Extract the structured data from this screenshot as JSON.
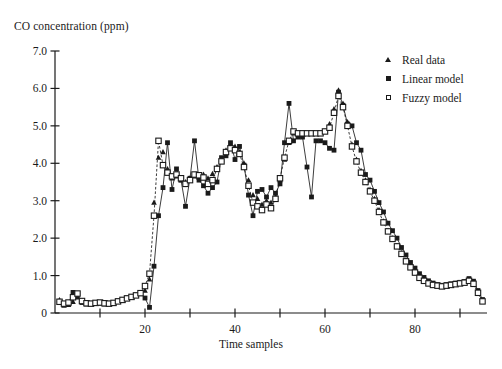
{
  "chart_data": {
    "type": "line",
    "title": "",
    "ylabel": "CO concentration (ppm)",
    "xlabel": "Time samples",
    "xlim": [
      0,
      96
    ],
    "ylim": [
      0,
      7.0
    ],
    "grid": false,
    "legend_position": "top-right",
    "yticks": [
      0,
      1.0,
      2.0,
      3.0,
      4.0,
      5.0,
      6.0,
      7.0
    ],
    "ytick_labels": [
      "0",
      "1.0",
      "2.0",
      "3.0",
      "4.0",
      "5.0",
      "6.0",
      "7.0"
    ],
    "xticks": [
      0,
      10,
      20,
      30,
      40,
      50,
      60,
      70,
      80,
      90
    ],
    "xtick_labels": [
      "",
      "",
      "20",
      "",
      "40",
      "",
      "60",
      "",
      "80",
      ""
    ],
    "x": [
      1,
      2,
      3,
      4,
      5,
      6,
      7,
      8,
      9,
      10,
      11,
      12,
      13,
      14,
      15,
      16,
      17,
      18,
      19,
      20,
      21,
      22,
      23,
      24,
      25,
      26,
      27,
      28,
      29,
      30,
      31,
      32,
      33,
      34,
      35,
      36,
      37,
      38,
      39,
      40,
      41,
      42,
      43,
      44,
      45,
      46,
      47,
      48,
      49,
      50,
      51,
      52,
      53,
      54,
      55,
      56,
      57,
      58,
      59,
      60,
      61,
      62,
      63,
      64,
      65,
      66,
      67,
      68,
      69,
      70,
      71,
      72,
      73,
      74,
      75,
      76,
      77,
      78,
      79,
      80,
      81,
      82,
      83,
      84,
      85,
      86,
      87,
      88,
      89,
      90,
      91,
      92,
      93,
      94,
      95
    ],
    "series": [
      {
        "name": "Real data",
        "marker": "filled-triangle",
        "line": "none",
        "color": "#1a1a1a",
        "values": [
          0.35,
          0.2,
          0.22,
          0.3,
          0.42,
          0.3,
          0.26,
          0.24,
          0.26,
          0.28,
          0.26,
          0.24,
          0.26,
          0.3,
          0.34,
          0.38,
          0.42,
          0.46,
          0.52,
          0.6,
          0.9,
          2.95,
          4.15,
          4.3,
          3.85,
          3.6,
          3.65,
          3.55,
          3.5,
          3.6,
          3.65,
          3.62,
          3.7,
          3.6,
          3.72,
          3.9,
          4.1,
          4.35,
          4.5,
          4.45,
          4.3,
          4.0,
          3.55,
          3.15,
          3.05,
          2.9,
          3.0,
          2.95,
          3.1,
          3.55,
          4.1,
          4.55,
          4.8,
          4.8,
          4.8,
          4.8,
          4.8,
          4.8,
          4.8,
          4.85,
          5.05,
          5.45,
          5.95,
          5.6,
          5.1,
          4.5,
          4.1,
          3.8,
          3.55,
          3.3,
          3.05,
          2.75,
          2.45,
          2.2,
          2.0,
          1.8,
          1.6,
          1.4,
          1.25,
          1.1,
          0.95,
          0.88,
          0.8,
          0.76,
          0.74,
          0.72,
          0.74,
          0.76,
          0.78,
          0.8,
          0.82,
          0.88,
          0.8,
          0.55,
          0.32
        ]
      },
      {
        "name": "Linear model",
        "marker": "filled-square",
        "line": "solid",
        "color": "#1a1a1a",
        "values": [
          0.3,
          0.24,
          0.26,
          0.55,
          0.5,
          0.28,
          0.24,
          0.26,
          0.28,
          0.26,
          0.24,
          0.26,
          0.28,
          0.32,
          0.36,
          0.4,
          0.44,
          0.48,
          0.54,
          0.4,
          0.15,
          1.25,
          2.6,
          3.35,
          4.55,
          3.3,
          3.85,
          3.55,
          2.85,
          3.6,
          4.6,
          3.55,
          3.4,
          3.2,
          3.35,
          3.5,
          4.15,
          4.2,
          4.55,
          4.1,
          4.45,
          3.95,
          3.15,
          2.6,
          3.25,
          3.3,
          3.1,
          3.35,
          3.2,
          3.45,
          4.55,
          5.6,
          4.6,
          4.7,
          4.7,
          3.9,
          3.1,
          4.6,
          4.6,
          4.55,
          4.4,
          4.35,
          5.9,
          5.55,
          5.05,
          5.0,
          4.55,
          4.35,
          3.7,
          3.55,
          3.25,
          2.95,
          2.7,
          2.4,
          2.2,
          2.0,
          1.75,
          1.55,
          1.35,
          1.2,
          1.05,
          0.95,
          0.86,
          0.8,
          0.76,
          0.74,
          0.76,
          0.78,
          0.8,
          0.82,
          0.84,
          0.92,
          0.85,
          0.6,
          0.36
        ]
      },
      {
        "name": "Fuzzy model",
        "marker": "open-square",
        "line": "dashed",
        "color": "#1a1a1a",
        "values": [
          0.3,
          0.25,
          0.28,
          0.42,
          0.52,
          0.32,
          0.26,
          0.25,
          0.27,
          0.28,
          0.26,
          0.25,
          0.27,
          0.31,
          0.35,
          0.39,
          0.43,
          0.47,
          0.53,
          0.72,
          1.05,
          2.6,
          4.6,
          3.95,
          3.75,
          3.65,
          3.7,
          3.6,
          3.45,
          3.55,
          3.7,
          3.68,
          3.62,
          3.45,
          3.55,
          3.85,
          4.05,
          4.3,
          4.4,
          4.35,
          4.25,
          3.9,
          3.4,
          2.95,
          2.85,
          2.75,
          2.9,
          2.8,
          3.05,
          3.6,
          4.15,
          4.6,
          4.85,
          4.8,
          4.8,
          4.8,
          4.8,
          4.8,
          4.8,
          4.85,
          4.95,
          5.35,
          5.8,
          5.5,
          5.0,
          4.45,
          4.05,
          3.75,
          3.5,
          3.25,
          3.0,
          2.7,
          2.42,
          2.18,
          1.98,
          1.78,
          1.58,
          1.38,
          1.22,
          1.08,
          0.94,
          0.86,
          0.79,
          0.75,
          0.73,
          0.71,
          0.73,
          0.75,
          0.77,
          0.79,
          0.81,
          0.86,
          0.78,
          0.54,
          0.31
        ]
      }
    ]
  },
  "legend": {
    "items": [
      {
        "label": "Real data",
        "marker": "filled-triangle"
      },
      {
        "label": "Linear model",
        "marker": "filled-square"
      },
      {
        "label": "Fuzzy model",
        "marker": "open-square"
      }
    ]
  }
}
